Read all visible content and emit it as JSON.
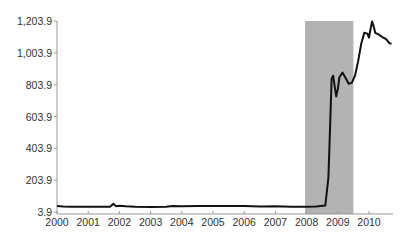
{
  "chart_data": {
    "type": "line",
    "title": "",
    "xlabel": "",
    "ylabel": "",
    "ylim": [
      3.9,
      1203.9
    ],
    "xlim": [
      2000,
      2010.8
    ],
    "yticks": [
      "3.9",
      "203.9",
      "403.9",
      "603.9",
      "803.9",
      "1,003.9",
      "1,203.9"
    ],
    "ytick_values": [
      3.9,
      203.9,
      403.9,
      603.9,
      803.9,
      1003.9,
      1203.9
    ],
    "xticks": [
      "2000",
      "2001",
      "2002",
      "2003",
      "2004",
      "2005",
      "2006",
      "2007",
      "2008",
      "2009",
      "2010"
    ],
    "xtick_values": [
      2000,
      2001,
      2002,
      2003,
      2004,
      2005,
      2006,
      2007,
      2008,
      2009,
      2010
    ],
    "grid": false,
    "legend": null,
    "shaded_region": {
      "x_start": 2007.95,
      "x_end": 2009.5,
      "color": "#b3b3b3"
    },
    "series": [
      {
        "name": "series",
        "color": "#111111",
        "x": [
          2000.0,
          2000.2,
          2000.5,
          2001.0,
          2001.5,
          2001.7,
          2001.8,
          2001.9,
          2002.0,
          2002.2,
          2002.5,
          2003.0,
          2003.5,
          2003.7,
          2004.0,
          2004.5,
          2005.0,
          2005.5,
          2006.0,
          2006.5,
          2007.0,
          2007.5,
          2008.0,
          2008.3,
          2008.6,
          2008.7,
          2008.75,
          2008.8,
          2008.85,
          2008.95,
          2009.0,
          2009.05,
          2009.15,
          2009.25,
          2009.35,
          2009.45,
          2009.55,
          2009.65,
          2009.75,
          2009.85,
          2009.95,
          2010.0,
          2010.05,
          2010.1,
          2010.15,
          2010.2,
          2010.3,
          2010.45,
          2010.55,
          2010.65,
          2010.72
        ],
        "y": [
          42,
          38,
          37,
          37,
          37,
          37,
          55,
          40,
          43,
          40,
          37,
          36,
          37,
          41,
          40,
          42,
          42,
          42,
          41,
          38,
          40,
          37,
          37,
          38,
          45,
          220,
          520,
          840,
          860,
          730,
          775,
          850,
          880,
          845,
          810,
          815,
          860,
          950,
          1060,
          1130,
          1125,
          1100,
          1155,
          1200,
          1170,
          1130,
          1120,
          1100,
          1090,
          1065,
          1060
        ]
      }
    ]
  }
}
